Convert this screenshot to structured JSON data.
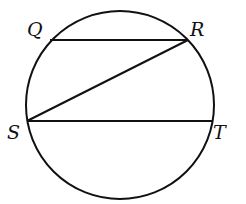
{
  "diagram": {
    "type": "circle-with-chords",
    "circle": {
      "cx": 120,
      "cy": 105,
      "r": 94
    },
    "points": [
      {
        "id": "Q",
        "label": "Q",
        "x": 50,
        "y": 40,
        "label_x": 27,
        "label_y": 36
      },
      {
        "id": "R",
        "label": "R",
        "x": 188,
        "y": 40,
        "label_x": 190,
        "label_y": 36
      },
      {
        "id": "S",
        "label": "S",
        "x": 27,
        "y": 121,
        "label_x": 7,
        "label_y": 139
      },
      {
        "id": "T",
        "label": "T",
        "x": 213,
        "y": 121,
        "label_x": 213,
        "label_y": 139
      }
    ],
    "segments": [
      {
        "name": "QR",
        "from": "Q",
        "to": "R"
      },
      {
        "name": "RS",
        "from": "R",
        "to": "S"
      },
      {
        "name": "ST",
        "from": "S",
        "to": "T"
      }
    ],
    "stroke_color": "#111111"
  }
}
